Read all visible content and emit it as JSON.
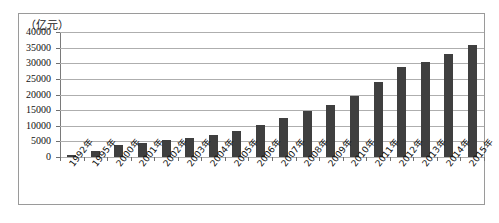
{
  "chart_data": {
    "type": "bar",
    "title": "（亿元）",
    "xlabel": "",
    "ylabel": "（亿元）",
    "ylim": [
      0,
      40000
    ],
    "ytick_step": 5000,
    "grid": true,
    "legend": "none",
    "bar_color": "#3f3f3f",
    "categories": [
      "1992年",
      "1995年",
      "2000年",
      "2001年",
      "2002年",
      "2003年",
      "2004年",
      "2005年",
      "2006年",
      "2007年",
      "2008年",
      "2009年",
      "2010年",
      "2011年",
      "2012年",
      "2013年",
      "2014年",
      "2015年"
    ],
    "values": [
      600,
      1800,
      3800,
      4600,
      5400,
      6100,
      7200,
      8400,
      10100,
      12400,
      14700,
      16700,
      19600,
      24000,
      28800,
      30500,
      33000,
      36000
    ],
    "ytick_labels": [
      "40000",
      "35000",
      "30000",
      "25000",
      "20000",
      "15000",
      "10000",
      "5000",
      "0"
    ],
    "ytick_values": [
      40000,
      35000,
      30000,
      25000,
      20000,
      15000,
      10000,
      5000,
      0
    ]
  }
}
